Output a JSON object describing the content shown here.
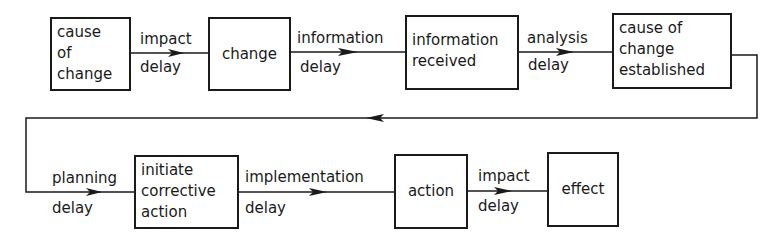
{
  "diagram": {
    "colors": {
      "ink": "#1a1a1a",
      "background": "#ffffff"
    },
    "nodes": [
      {
        "id": "cause-of-change",
        "lines": [
          "cause",
          "of",
          "change"
        ]
      },
      {
        "id": "change",
        "lines": [
          "change"
        ]
      },
      {
        "id": "information-received",
        "lines": [
          "information",
          "received"
        ]
      },
      {
        "id": "cause-of-change-established",
        "lines": [
          "cause of",
          "change",
          "established"
        ]
      },
      {
        "id": "initiate-corrective-action",
        "lines": [
          "initiate",
          "corrective",
          "action"
        ]
      },
      {
        "id": "action",
        "lines": [
          "action"
        ]
      },
      {
        "id": "effect",
        "lines": [
          "effect"
        ]
      }
    ],
    "edges": [
      {
        "from": "cause-of-change",
        "to": "change",
        "top": "impact",
        "bottom": "delay"
      },
      {
        "from": "change",
        "to": "information-received",
        "top": "information",
        "bottom": "delay"
      },
      {
        "from": "information-received",
        "to": "cause-of-change-established",
        "top": "analysis",
        "bottom": "delay"
      },
      {
        "from": "cause-of-change-established",
        "to": "initiate-corrective-action",
        "top": "planning",
        "bottom": "delay"
      },
      {
        "from": "initiate-corrective-action",
        "to": "action",
        "top": "implementation",
        "bottom": "delay"
      },
      {
        "from": "action",
        "to": "effect",
        "top": "impact",
        "bottom": "delay"
      }
    ]
  }
}
